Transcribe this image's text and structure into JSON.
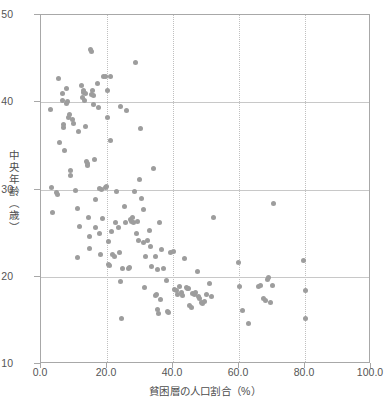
{
  "chart_data": {
    "type": "scatter",
    "title": "",
    "xlabel": "貧困層の人口割合（%）",
    "ylabel": "中央年齢（歳）",
    "xlim": [
      0.0,
      100.0
    ],
    "ylim": [
      10,
      50
    ],
    "xticks": [
      "0.0",
      "20.0",
      "40.0",
      "60.0",
      "80.0",
      "100.0"
    ],
    "xtick_values": [
      0,
      20,
      40,
      60,
      80,
      100
    ],
    "yticks": [
      "10",
      "20",
      "30",
      "40",
      "50"
    ],
    "ytick_values": [
      10,
      20,
      30,
      40,
      50
    ],
    "grid": true,
    "grid_axes": "both",
    "legend": null,
    "marker_color": "#9d9d9d",
    "marker_size_px": 5,
    "axis_color": "#a8a8a8",
    "grid_color": "#c8c8c8",
    "points": [
      [
        3.0,
        39.2
      ],
      [
        3.2,
        30.2
      ],
      [
        3.4,
        27.4
      ],
      [
        4.6,
        29.6
      ],
      [
        5.0,
        29.4
      ],
      [
        5.2,
        42.7
      ],
      [
        5.6,
        35.4
      ],
      [
        6.4,
        41.0
      ],
      [
        6.6,
        40.2
      ],
      [
        6.8,
        37.4
      ],
      [
        6.9,
        37.1
      ],
      [
        7.2,
        34.5
      ],
      [
        7.6,
        41.6
      ],
      [
        7.8,
        39.9
      ],
      [
        8.0,
        40.1
      ],
      [
        8.4,
        38.3
      ],
      [
        8.6,
        38.6
      ],
      [
        8.8,
        32.2
      ],
      [
        9.0,
        31.6
      ],
      [
        9.4,
        38.0
      ],
      [
        9.8,
        37.6
      ],
      [
        10.6,
        29.9
      ],
      [
        11.0,
        27.8
      ],
      [
        11.2,
        22.2
      ],
      [
        11.4,
        36.7
      ],
      [
        11.8,
        25.8
      ],
      [
        12.2,
        41.9
      ],
      [
        12.6,
        40.6
      ],
      [
        12.8,
        41.1
      ],
      [
        13.0,
        41.3
      ],
      [
        13.2,
        40.2
      ],
      [
        13.4,
        41.0
      ],
      [
        13.6,
        37.2
      ],
      [
        13.8,
        33.2
      ],
      [
        14.0,
        32.8
      ],
      [
        14.2,
        33.0
      ],
      [
        14.4,
        26.8
      ],
      [
        14.6,
        24.6
      ],
      [
        14.8,
        23.2
      ],
      [
        15.0,
        46.1
      ],
      [
        15.2,
        45.8
      ],
      [
        15.4,
        40.9
      ],
      [
        15.6,
        41.4
      ],
      [
        15.8,
        39.7
      ],
      [
        16.0,
        40.8
      ],
      [
        16.2,
        33.4
      ],
      [
        16.4,
        28.8
      ],
      [
        16.6,
        25.6
      ],
      [
        17.0,
        42.2
      ],
      [
        17.4,
        39.4
      ],
      [
        17.6,
        30.1
      ],
      [
        17.8,
        24.9
      ],
      [
        18.0,
        22.5
      ],
      [
        18.4,
        30.0
      ],
      [
        18.6,
        26.7
      ],
      [
        19.0,
        42.9
      ],
      [
        19.4,
        43.0
      ],
      [
        19.6,
        30.2
      ],
      [
        19.8,
        30.3
      ],
      [
        20.0,
        41.4
      ],
      [
        20.2,
        38.2
      ],
      [
        20.4,
        24.0
      ],
      [
        20.6,
        21.4
      ],
      [
        20.8,
        21.3
      ],
      [
        21.0,
        43.0
      ],
      [
        21.2,
        35.6
      ],
      [
        21.4,
        25.2
      ],
      [
        21.8,
        22.5
      ],
      [
        22.2,
        22.3
      ],
      [
        22.6,
        26.2
      ],
      [
        23.0,
        29.8
      ],
      [
        23.4,
        25.6
      ],
      [
        23.8,
        22.8
      ],
      [
        24.0,
        39.5
      ],
      [
        24.2,
        19.5
      ],
      [
        24.4,
        15.2
      ],
      [
        24.8,
        21.0
      ],
      [
        25.2,
        28.0
      ],
      [
        25.6,
        26.2
      ],
      [
        25.8,
        39.1
      ],
      [
        26.4,
        20.9
      ],
      [
        26.8,
        21.1
      ],
      [
        27.0,
        26.6
      ],
      [
        27.4,
        26.3
      ],
      [
        27.8,
        26.8
      ],
      [
        28.0,
        26.2
      ],
      [
        28.4,
        29.8
      ],
      [
        28.6,
        44.6
      ],
      [
        29.0,
        25.0
      ],
      [
        29.2,
        26.3
      ],
      [
        29.4,
        24.1
      ],
      [
        29.8,
        31.2
      ],
      [
        30.2,
        37.0
      ],
      [
        30.6,
        29.0
      ],
      [
        31.0,
        27.7
      ],
      [
        31.2,
        23.9
      ],
      [
        31.4,
        18.8
      ],
      [
        31.8,
        22.3
      ],
      [
        32.2,
        24.1
      ],
      [
        32.8,
        25.3
      ],
      [
        33.2,
        23.5
      ],
      [
        33.6,
        21.2
      ],
      [
        34.2,
        32.4
      ],
      [
        34.6,
        22.3
      ],
      [
        34.8,
        17.9
      ],
      [
        35.0,
        18.0
      ],
      [
        35.2,
        20.8
      ],
      [
        35.4,
        16.3
      ],
      [
        35.6,
        15.8
      ],
      [
        35.8,
        26.2
      ],
      [
        36.2,
        17.4
      ],
      [
        36.4,
        23.1
      ],
      [
        37.0,
        20.9
      ],
      [
        38.0,
        19.6
      ],
      [
        38.4,
        16.0
      ],
      [
        38.6,
        15.9
      ],
      [
        39.2,
        22.8
      ],
      [
        40.0,
        22.9
      ],
      [
        40.6,
        18.5
      ],
      [
        41.0,
        18.4
      ],
      [
        41.4,
        18.0
      ],
      [
        42.0,
        18.9
      ],
      [
        42.6,
        18.2
      ],
      [
        43.0,
        17.9
      ],
      [
        43.4,
        22.1
      ],
      [
        44.0,
        18.8
      ],
      [
        44.4,
        18.6
      ],
      [
        44.6,
        18.7
      ],
      [
        45.0,
        16.7
      ],
      [
        45.6,
        16.5
      ],
      [
        46.0,
        18.1
      ],
      [
        46.4,
        18.0
      ],
      [
        46.8,
        18.2
      ],
      [
        47.4,
        20.6
      ],
      [
        47.8,
        17.7
      ],
      [
        48.0,
        17.5
      ],
      [
        48.6,
        17.0
      ],
      [
        49.0,
        16.9
      ],
      [
        49.4,
        17.2
      ],
      [
        50.0,
        18.0
      ],
      [
        51.0,
        19.2
      ],
      [
        51.6,
        17.7
      ],
      [
        52.4,
        26.8
      ],
      [
        59.8,
        21.6
      ],
      [
        60.2,
        18.9
      ],
      [
        61.0,
        16.1
      ],
      [
        63.0,
        14.6
      ],
      [
        65.8,
        18.9
      ],
      [
        66.4,
        19.0
      ],
      [
        67.4,
        17.5
      ],
      [
        68.0,
        17.3
      ],
      [
        68.6,
        19.7
      ],
      [
        69.0,
        19.9
      ],
      [
        69.4,
        17.0
      ],
      [
        70.0,
        19.0
      ],
      [
        70.4,
        28.4
      ],
      [
        79.6,
        21.9
      ],
      [
        80.0,
        18.4
      ],
      [
        80.2,
        15.2
      ]
    ]
  }
}
